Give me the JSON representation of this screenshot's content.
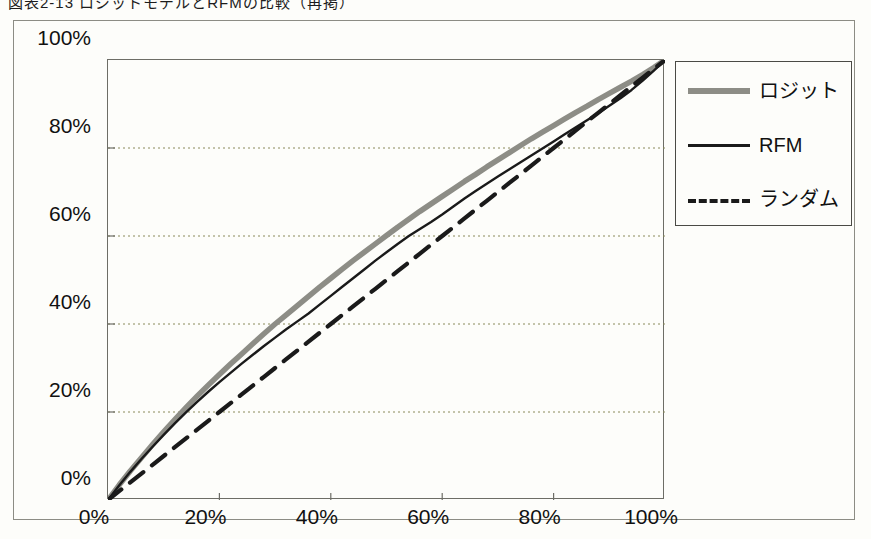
{
  "caption": "図表2-13  ロジットモデルとRFMの比較（再掲）",
  "figure": {
    "background_color": "#fdfdfa",
    "frame_color": "#8c8c84",
    "axis_color": "#6d6d66",
    "grid_color": "#8a8a5a"
  },
  "legend": {
    "position": "right",
    "items": [
      {
        "label": "ロジット",
        "style": "solid-thick",
        "color": "#8d8d86",
        "icon": "line-swatch-icon"
      },
      {
        "label": "RFM",
        "style": "solid-thin",
        "color": "#1a1a1a",
        "icon": "line-swatch-icon"
      },
      {
        "label": "ランダム",
        "style": "dashed",
        "color": "#1a1a1a",
        "icon": "dashed-line-swatch-icon"
      }
    ]
  },
  "chart_data": {
    "type": "line",
    "title": "図表2-13  ロジットモデルとRFMの比較（再掲）",
    "xlabel": "",
    "ylabel": "",
    "xlim": [
      0,
      100
    ],
    "ylim": [
      0,
      100
    ],
    "grid": true,
    "xticks": [
      "0%",
      "20%",
      "40%",
      "60%",
      "80%",
      "100%"
    ],
    "yticks": [
      "0%",
      "20%",
      "40%",
      "60%",
      "80%",
      "100%"
    ],
    "xtick_values": [
      0,
      20,
      40,
      60,
      80,
      100
    ],
    "ytick_values": [
      0,
      20,
      40,
      60,
      80,
      100
    ],
    "x": [
      0,
      2,
      4,
      6,
      8,
      10,
      12,
      14,
      16,
      18,
      20,
      22,
      24,
      26,
      28,
      30,
      32,
      34,
      36,
      38,
      40,
      42,
      44,
      46,
      48,
      50,
      52,
      54,
      56,
      58,
      60,
      62,
      64,
      66,
      68,
      70,
      72,
      74,
      76,
      78,
      80,
      82,
      84,
      86,
      88,
      90,
      92,
      94,
      96,
      98,
      100
    ],
    "series": [
      {
        "name": "ロジット",
        "color": "#8d8d86",
        "style": "solid-thick",
        "values": [
          0,
          3.4,
          6.6,
          9.6,
          12.6,
          15.5,
          18.3,
          21.0,
          23.6,
          26.1,
          28.5,
          30.9,
          33.2,
          35.5,
          37.8,
          40.0,
          42.1,
          44.2,
          46.3,
          48.4,
          50.4,
          52.4,
          54.4,
          56.3,
          58.2,
          60.1,
          62.0,
          63.8,
          65.6,
          67.3,
          69.0,
          70.7,
          72.4,
          74.0,
          75.7,
          77.3,
          78.9,
          80.5,
          82.1,
          83.6,
          85.1,
          86.6,
          88.1,
          89.5,
          91.0,
          92.4,
          93.8,
          95.2,
          96.7,
          98.3,
          100
        ]
      },
      {
        "name": "RFM",
        "color": "#1a1a1a",
        "style": "solid-thin",
        "values": [
          0,
          3.3,
          6.4,
          9.3,
          12.1,
          14.8,
          17.4,
          19.9,
          22.3,
          24.6,
          26.8,
          28.9,
          31.0,
          33.0,
          35.0,
          36.9,
          38.8,
          40.6,
          42.4,
          44.4,
          46.4,
          48.4,
          50.4,
          52.4,
          54.4,
          56.3,
          58.2,
          60.0,
          61.6,
          63.2,
          64.9,
          66.7,
          68.5,
          70.2,
          71.9,
          73.5,
          75.1,
          76.7,
          78.3,
          79.9,
          81.5,
          83.1,
          84.7,
          86.3,
          87.9,
          89.6,
          91.3,
          93.2,
          95.3,
          97.6,
          100
        ]
      },
      {
        "name": "ランダム",
        "color": "#1a1a1a",
        "style": "dashed",
        "values": [
          0,
          2,
          4,
          6,
          8,
          10,
          12,
          14,
          16,
          18,
          20,
          22,
          24,
          26,
          28,
          30,
          32,
          34,
          36,
          38,
          40,
          42,
          44,
          46,
          48,
          50,
          52,
          54,
          56,
          58,
          60,
          62,
          64,
          66,
          68,
          70,
          72,
          74,
          76,
          78,
          80,
          82,
          84,
          86,
          88,
          90,
          92,
          94,
          96,
          98,
          100
        ]
      }
    ]
  }
}
